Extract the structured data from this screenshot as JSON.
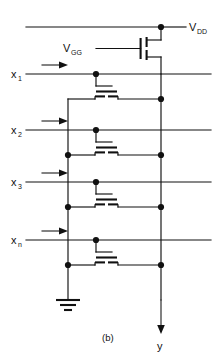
{
  "figure": {
    "caption": "(b)",
    "title_text": "",
    "colors": {
      "line": "#111111",
      "background": "#ffffff",
      "text": "#111111"
    }
  },
  "labels": {
    "vdd": {
      "base": "V",
      "sub": "DD"
    },
    "vgg": {
      "base": "V",
      "sub": "GG"
    },
    "output": {
      "base": "y",
      "sub": ""
    },
    "inputs": [
      {
        "base": "x",
        "sub": "1"
      },
      {
        "base": "x",
        "sub": "2"
      },
      {
        "base": "x",
        "sub": "3"
      },
      {
        "base": "x",
        "sub": "n"
      }
    ]
  },
  "nodes": {
    "supply_rail_label": "VDD rail",
    "ground_label": "ground",
    "output_rail_label": "y output rail"
  },
  "geometry": {
    "vdd_rail_y": 27,
    "out_rail_x": 161,
    "left_rail_x": 68,
    "input_rows_y": [
      74,
      130,
      182,
      240
    ],
    "tap_rows_y": [
      99,
      155,
      207,
      265
    ],
    "gnd_y": 300
  }
}
